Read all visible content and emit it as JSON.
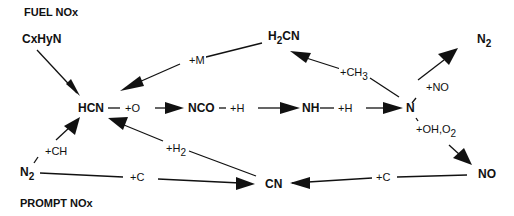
{
  "sections": {
    "fuel": "FUEL NOx",
    "prompt": "PROMPT NOx"
  },
  "nodes": {
    "cxhyn": "CxHyN",
    "hcn": "HCN",
    "nco": "NCO",
    "nh": "NH",
    "n": "N",
    "h2cn_main": "H",
    "h2cn_sub": "2",
    "h2cn_rest": "CN",
    "n2_top_main": "N",
    "n2_top_sub": "2",
    "no": "NO",
    "cn": "CN",
    "n2_bot_main": "N",
    "n2_bot_sub": "2"
  },
  "labels": {
    "plus_m": "+M",
    "plus_ch3_main": "+CH",
    "plus_ch3_sub": "3",
    "plus_o": "+O",
    "plus_h_1": "+H",
    "plus_h_2": "+H",
    "plus_no": "+NO",
    "plus_ohO2_main": "+OH,O",
    "plus_ohO2_sub": "2",
    "plus_h2_main": "+H",
    "plus_h2_sub": "2",
    "plus_ch": "+CH",
    "plus_c_left": "+C",
    "plus_c_right": "+C"
  },
  "colors": {
    "ink": "#111111",
    "background": "#ffffff"
  }
}
